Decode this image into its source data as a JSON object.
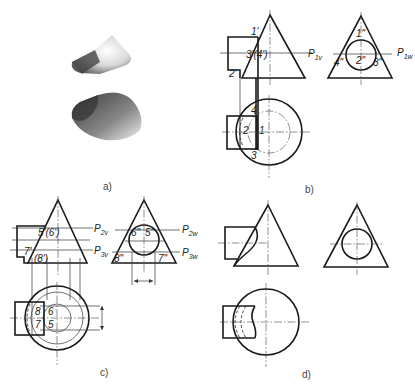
{
  "header_text": "",
  "captions": {
    "a": "a)",
    "b": "b)",
    "c": "c)",
    "d": "d)"
  },
  "panel_b": {
    "front_labels": {
      "p1": "1'",
      "p34": "3'(4')",
      "p2": "2'"
    },
    "plane_front": {
      "main": "P",
      "sub": "1v"
    },
    "side_labels": {
      "p1": "1\"",
      "p2": "2\"",
      "p3": "3\"",
      "p4": "4\""
    },
    "plane_side": {
      "main": "P",
      "sub": "1w"
    },
    "top_labels": {
      "p1": "1",
      "p2": "2",
      "p3": "3",
      "p4": "4"
    }
  },
  "panel_c": {
    "front_labels": {
      "p56": "5'(6')",
      "p7": "7'",
      "p8": "(8')"
    },
    "plane_front_2": {
      "main": "P",
      "sub": "2v"
    },
    "plane_front_3": {
      "main": "P",
      "sub": "3v"
    },
    "side_labels": {
      "p6": "6\"",
      "p5": "5\"",
      "p8": "8\"",
      "p7": "7\""
    },
    "plane_side_2": {
      "main": "P",
      "sub": "2w"
    },
    "plane_side_3": {
      "main": "P",
      "sub": "3w"
    },
    "top_labels": {
      "p8": "8",
      "p6": "6",
      "p7": "7",
      "p5": "5"
    }
  },
  "panel_d": {}
}
